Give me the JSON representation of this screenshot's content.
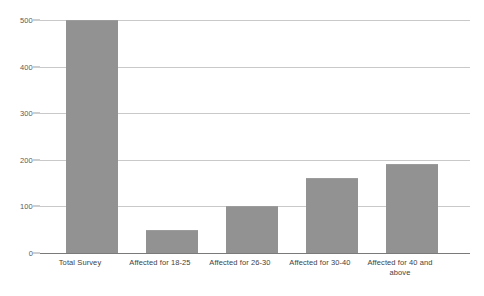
{
  "chart_data": {
    "type": "bar",
    "title": "",
    "subtitle": "",
    "xlabel": "",
    "ylabel": "",
    "categories": [
      "Total Survey",
      "Affected for 18-25",
      "Affected for 26-30",
      "Affected for 30-40",
      "Affected for 40 and above"
    ],
    "values": [
      500,
      50,
      100,
      160,
      190
    ],
    "ylim": [
      0,
      500
    ],
    "yticks": [
      0,
      100,
      200,
      300,
      400,
      500
    ],
    "ytick_labels": [
      "0",
      "100",
      "200",
      "300",
      "400",
      "500"
    ],
    "grid": true,
    "legend": false,
    "legend_position": "none",
    "annotations": [],
    "colors": {
      "bar_fill": "#929292",
      "bar_edge": "#9c9c9c",
      "gridline": "#c9c9c9",
      "axis_line": "#7a7a7a",
      "tick_label": "#5a5a5a",
      "category_label": "#3f3f3f",
      "background": "#ffffff"
    }
  }
}
